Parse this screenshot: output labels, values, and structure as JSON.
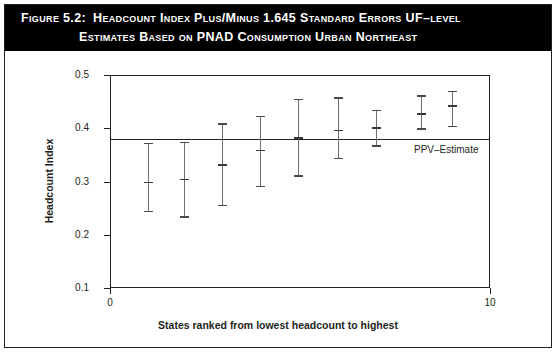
{
  "figure": {
    "number_label": "Figure 5.2:",
    "title_line_1": "Headcount Index Plus/Minus 1.645 Standard Errors UF–level",
    "title_line_2": "Estimates Based on PNAD Consumption Urban Northeast",
    "banner_color": "#000000",
    "banner_text_color": "#ffffff",
    "border_color": "#231f20"
  },
  "chart_data": {
    "type": "scatter",
    "title": "Headcount Index Plus/Minus 1.645 Standard Errors UF–level Estimates Based on PNAD Consumption Urban Northeast",
    "xlabel": "States ranked from lowest headcount to highest",
    "ylabel": "Headcount Index",
    "xlim": [
      0,
      10
    ],
    "ylim": [
      0.1,
      0.5
    ],
    "xticks": [
      0,
      10
    ],
    "xtick_labels": [
      "0",
      "10"
    ],
    "yticks": [
      0.1,
      0.2,
      0.3,
      0.4,
      0.5
    ],
    "ytick_labels": [
      "0.1",
      "0.2",
      "0.3",
      "0.4",
      "0.5"
    ],
    "grid": false,
    "legend": false,
    "error_bar_multiplier": 1.645,
    "reference_line": {
      "label": "PPV–Estimate",
      "value": 0.38,
      "orientation": "horizontal"
    },
    "series": [
      {
        "name": "Headcount Index with 1.645 SE bounds",
        "x": [
          1.0,
          1.95,
          2.95,
          3.95,
          4.95,
          6.0,
          7.0,
          8.2,
          9.0
        ],
        "values": [
          0.3,
          0.305,
          0.333,
          0.36,
          0.383,
          0.397,
          0.402,
          0.428,
          0.443
        ],
        "lower": [
          0.245,
          0.235,
          0.256,
          0.292,
          0.312,
          0.345,
          0.368,
          0.4,
          0.405
        ],
        "upper": [
          0.373,
          0.375,
          0.409,
          0.423,
          0.455,
          0.458,
          0.435,
          0.462,
          0.47
        ]
      }
    ]
  }
}
